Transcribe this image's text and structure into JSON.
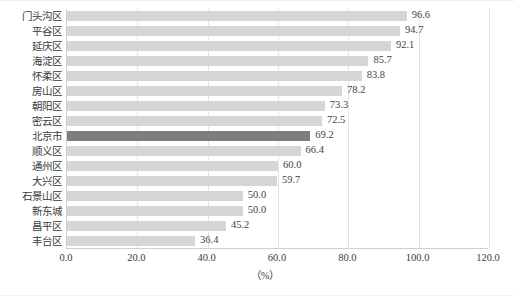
{
  "chart_data": {
    "type": "bar",
    "orientation": "horizontal",
    "title": "",
    "subtitle": "",
    "xlabel": "（%）",
    "ylabel": "",
    "xlim": [
      0.0,
      120.0
    ],
    "xticks": [
      "0.0",
      "20.0",
      "40.0",
      "60.0",
      "80.0",
      "100.0",
      "120.0"
    ],
    "xtick_values": [
      0,
      20,
      40,
      60,
      80,
      100,
      120
    ],
    "grid": "vertical",
    "legend": "none",
    "categories": [
      "门头沟区",
      "平谷区",
      "延庆区",
      "海淀区",
      "怀柔区",
      "房山区",
      "朝阳区",
      "密云区",
      "北京市",
      "顺义区",
      "通州区",
      "大兴区",
      "石景山区",
      "新东城",
      "昌平区",
      "丰台区"
    ],
    "values": [
      96.6,
      94.7,
      92.1,
      85.7,
      83.8,
      78.2,
      73.3,
      72.5,
      69.2,
      66.4,
      60.0,
      59.7,
      50.0,
      50.0,
      45.2,
      36.4
    ],
    "value_labels": [
      "96.6",
      "94.7",
      "92.1",
      "85.7",
      "83.8",
      "78.2",
      "73.3",
      "72.5",
      "69.2",
      "66.4",
      "60.0",
      "59.7",
      "50.0",
      "50.0",
      "45.2",
      "36.4"
    ],
    "highlight_index": 8,
    "highlight_category": "北京市",
    "colors": {
      "bar": "#d6d6d6",
      "bar_highlight": "#7d7d7d",
      "gridline": "#e4e4e4",
      "axis": "#d0d0d0",
      "text": "#3a3a3a",
      "background": "#ffffff"
    }
  }
}
